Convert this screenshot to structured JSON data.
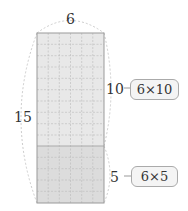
{
  "labels": {
    "width": "6",
    "height_total": "15",
    "height_top": "10",
    "height_bottom": "5"
  },
  "expressions": {
    "top": "6×10",
    "bottom": "6×5"
  },
  "grid": {
    "columns": 6,
    "rows": 15,
    "top_rows": 10,
    "bottom_rows": 5
  },
  "colors": {
    "top_fill": "#e8e8e8",
    "bottom_fill": "#dcdcdc",
    "grid_line": "#b8b8b8",
    "border": "#9a9a9a"
  }
}
